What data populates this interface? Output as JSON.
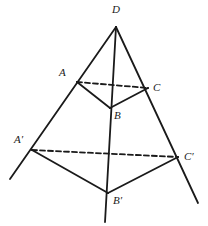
{
  "figure": {
    "background_color": "#ffffff",
    "stroke_color": "#1a1a1a",
    "stroke_width": 1.8,
    "dash_pattern": "5,3",
    "vertices": [
      {
        "id": "D",
        "label": "D",
        "x": 116,
        "y": 27,
        "label_x": 112,
        "label_y": 4,
        "hidden": false
      },
      {
        "id": "A",
        "label": "A",
        "x": 77,
        "y": 82,
        "label_x": 59,
        "label_y": 67,
        "hidden": false
      },
      {
        "id": "C",
        "label": "C",
        "x": 148,
        "y": 88,
        "label_x": 153,
        "label_y": 82,
        "hidden": false
      },
      {
        "id": "B",
        "label": "B",
        "x": 110,
        "y": 108,
        "label_x": 114,
        "label_y": 110,
        "hidden": false
      },
      {
        "id": "A'",
        "label": "A′",
        "x": 32,
        "y": 150,
        "label_x": 14,
        "label_y": 134,
        "hidden": false
      },
      {
        "id": "C'",
        "label": "C′",
        "x": 178,
        "y": 157,
        "label_x": 184,
        "label_y": 151,
        "hidden": false
      },
      {
        "id": "B'",
        "label": "B′",
        "x": 108,
        "y": 193,
        "label_x": 113,
        "label_y": 195,
        "hidden": false
      }
    ],
    "edges": [
      {
        "name": "edge-D-A-Aprime-extended",
        "from": "D",
        "to": "ext-left",
        "x1": 116,
        "y1": 27,
        "x2": 10,
        "y2": 179,
        "style": "solid"
      },
      {
        "name": "edge-D-C-Cprime-extended",
        "from": "D",
        "to": "ext-right",
        "x1": 116,
        "y1": 27,
        "x2": 198,
        "y2": 203,
        "style": "solid"
      },
      {
        "name": "edge-D-B-Bprime-extended",
        "from": "D",
        "to": "ext-bottom",
        "x1": 116,
        "y1": 27,
        "x2": 105,
        "y2": 222,
        "style": "solid"
      },
      {
        "name": "edge-A-C-hidden",
        "from": "A",
        "to": "C",
        "x1": 77,
        "y1": 82,
        "x2": 148,
        "y2": 88,
        "style": "dashed"
      },
      {
        "name": "edge-A-B",
        "from": "A",
        "to": "B",
        "x1": 77,
        "y1": 82,
        "x2": 110,
        "y2": 108,
        "style": "solid"
      },
      {
        "name": "edge-B-C",
        "from": "B",
        "to": "C",
        "x1": 110,
        "y1": 108,
        "x2": 148,
        "y2": 88,
        "style": "solid"
      },
      {
        "name": "edge-Aprime-Cprime-hidden",
        "from": "A'",
        "to": "C'",
        "x1": 32,
        "y1": 150,
        "x2": 178,
        "y2": 157,
        "style": "dashed"
      },
      {
        "name": "edge-Aprime-Bprime",
        "from": "A'",
        "to": "B'",
        "x1": 32,
        "y1": 150,
        "x2": 108,
        "y2": 193,
        "style": "solid"
      },
      {
        "name": "edge-Bprime-Cprime",
        "from": "B'",
        "to": "C'",
        "x1": 108,
        "y1": 193,
        "x2": 178,
        "y2": 157,
        "style": "solid"
      }
    ]
  }
}
